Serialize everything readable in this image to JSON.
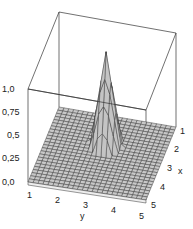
{
  "chart_data": {
    "type": "surface3d",
    "title": "",
    "xlabel": "x",
    "ylabel": "y",
    "zlabel": "",
    "x_ticks": [
      "1",
      "2",
      "3",
      "4",
      "5"
    ],
    "y_ticks": [
      "1",
      "2",
      "3",
      "4",
      "5"
    ],
    "z_ticks": [
      "0,0",
      "0,25",
      "0,5",
      "0,75",
      "1,0"
    ],
    "xlim": [
      1,
      5
    ],
    "ylim": [
      1,
      5
    ],
    "zlim": [
      0,
      1
    ],
    "peak": {
      "x": 2.5,
      "y": 3,
      "z": 1.0
    },
    "grid": true,
    "surface_color": "#c8c8c8",
    "mesh_color": "#333333"
  },
  "axes": {
    "z_labels": [
      "0,0",
      "0,25",
      "0,5",
      "0,75",
      "1,0"
    ],
    "y_labels": [
      "1",
      "2",
      "3",
      "4",
      "5"
    ],
    "x_labels": [
      "1",
      "2",
      "3",
      "4",
      "5"
    ],
    "y_title": "y",
    "x_title": "x"
  }
}
